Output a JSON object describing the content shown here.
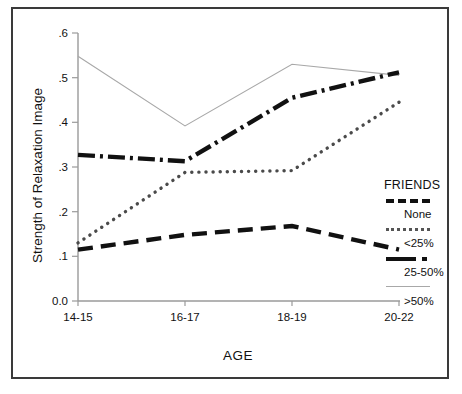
{
  "chart_data": {
    "type": "line",
    "title": "",
    "xlabel": "AGE",
    "ylabel": "Strength of Relaxation Image",
    "categories": [
      "14-15",
      "16-17",
      "18-19",
      "20-22"
    ],
    "ylim": [
      0.0,
      0.6
    ],
    "yticks": [
      "0.0",
      ".1",
      ".2",
      ".3",
      ".4",
      ".5",
      ".6"
    ],
    "ytick_values": [
      0.0,
      0.1,
      0.2,
      0.3,
      0.4,
      0.5,
      0.6
    ],
    "grid": false,
    "legend_position": "right",
    "legend_title": "FRIENDS",
    "series": [
      {
        "name": "None",
        "style": "dashed",
        "color": "#111111",
        "values": [
          0.115,
          0.148,
          0.168,
          0.115
        ]
      },
      {
        "name": "<25%",
        "style": "dotted",
        "color": "#555555",
        "values": [
          0.13,
          0.288,
          0.292,
          0.445
        ]
      },
      {
        "name": "25-50%",
        "style": "dash-dot",
        "color": "#111111",
        "values": [
          0.327,
          0.313,
          0.455,
          0.512
        ]
      },
      {
        "name": ">50%",
        "style": "solid-thin",
        "color": "#a8a8a8",
        "values": [
          0.548,
          0.392,
          0.53,
          0.505
        ]
      }
    ]
  },
  "axis": {
    "x_title": "AGE",
    "y_title": "Strength of Relaxation Image",
    "x_tick_labels": [
      "14-15",
      "16-17",
      "18-19",
      "20-22"
    ],
    "y_tick_labels": [
      ".6",
      ".5",
      ".4",
      ".3",
      ".2",
      ".1",
      "0.0"
    ]
  },
  "legend": {
    "title": "FRIENDS",
    "entries": [
      {
        "label": "None",
        "swatch": "dashed-line-swatch"
      },
      {
        "label": "<25%",
        "swatch": "dotted-line-swatch"
      },
      {
        "label": "25-50%",
        "swatch": "dash-dot-line-swatch"
      },
      {
        "label": ">50%",
        "swatch": "thin-solid-line-swatch"
      }
    ]
  }
}
